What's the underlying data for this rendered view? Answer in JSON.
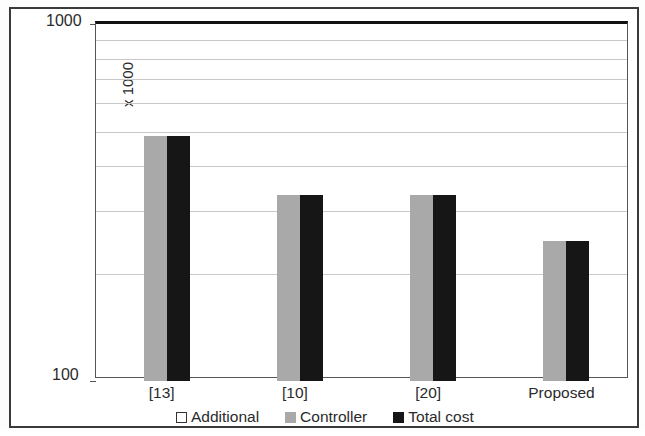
{
  "chart_data": {
    "type": "bar",
    "title": "",
    "subtitle": "",
    "xlabel": "",
    "ylabel": "Nand Gate eq. area (Log.)",
    "yunits": "x 1000",
    "yscale": "log",
    "ylim": [
      100,
      1000
    ],
    "ytick_labels": [
      "1000",
      "100"
    ],
    "gridlines": [
      900,
      800,
      700,
      600,
      500,
      400,
      300,
      200
    ],
    "grid": true,
    "legend_position": "bottom",
    "categories": [
      "[13]",
      "[10]",
      "[20]",
      "Proposed"
    ],
    "series": [
      {
        "name": "Additional",
        "color": "#ffffff",
        "values": [
          0,
          0,
          0,
          0
        ]
      },
      {
        "name": "Controller",
        "color": "#a9a9a9",
        "values": [
          485,
          332,
          332,
          247
        ]
      },
      {
        "name": "Total cost",
        "color": "#161616",
        "values": [
          485,
          332,
          332,
          247
        ]
      }
    ]
  },
  "legend": {
    "items": [
      {
        "label": "Additional",
        "swatch": "additional"
      },
      {
        "label": "Controller",
        "swatch": "controller"
      },
      {
        "label": "Total cost",
        "swatch": "total"
      }
    ]
  },
  "axes": {
    "y_top_label": "1000",
    "y_bottom_label": "100",
    "y_units_label": "x 1000",
    "y_title": "Nand Gate eq. area (Log.)"
  }
}
